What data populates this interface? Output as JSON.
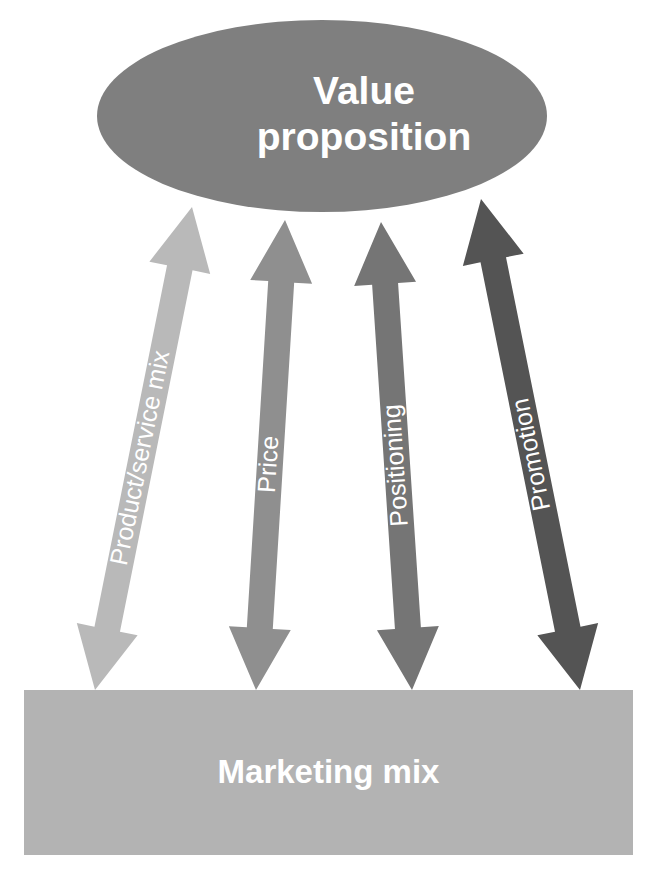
{
  "diagram": {
    "type": "marketing-value-proposition-relationship",
    "background_color": "#ffffff",
    "top_node": {
      "shape": "ellipse",
      "label_line1": "Value",
      "label_line2": "proposition",
      "fill_color": "#7f7f7f",
      "text_color": "#ffffff",
      "cx": 322,
      "cy": 116,
      "rx": 225,
      "ry": 96
    },
    "bottom_node": {
      "shape": "rectangle",
      "label": "Marketing mix",
      "fill_color": "#b3b3b3",
      "text_color": "#ffffff",
      "x": 24,
      "y": 690,
      "width": 609,
      "height": 165
    },
    "connectors": [
      {
        "label": "Product/service mix",
        "fill_color": "#b9b9b9",
        "text_color": "#ffffff",
        "top_x": 192,
        "top_y": 207,
        "bottom_x": 95,
        "bottom_y": 690,
        "shaft_width": 26,
        "head_width": 62,
        "head_length": 62,
        "double_headed": true
      },
      {
        "label": "Price",
        "fill_color": "#8f8f8f",
        "text_color": "#ffffff",
        "top_x": 285,
        "top_y": 220,
        "bottom_x": 256,
        "bottom_y": 690,
        "shaft_width": 26,
        "head_width": 62,
        "head_length": 62,
        "double_headed": true
      },
      {
        "label": "Positioning",
        "fill_color": "#757575",
        "text_color": "#ffffff",
        "top_x": 381,
        "top_y": 222,
        "bottom_x": 412,
        "bottom_y": 690,
        "shaft_width": 26,
        "head_width": 62,
        "head_length": 62,
        "double_headed": true
      },
      {
        "label": "Promotion",
        "fill_color": "#545454",
        "text_color": "#ffffff",
        "top_x": 481,
        "top_y": 199,
        "bottom_x": 580,
        "bottom_y": 690,
        "shaft_width": 26,
        "head_width": 62,
        "head_length": 62,
        "double_headed": true
      }
    ]
  }
}
